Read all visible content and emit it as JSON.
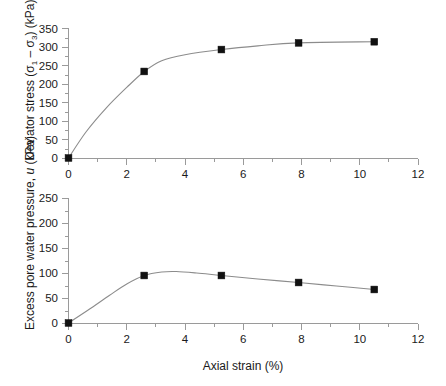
{
  "figure": {
    "background_color": "#ffffff",
    "line_color": "#8c8c8c",
    "marker_color": "#111111",
    "axis_color": "#9a9a9a",
    "text_color": "#1a1a1a"
  },
  "shared_axis": {
    "xlabel": "Axial strain (%)",
    "xticks": [
      "0",
      "2",
      "4",
      "6",
      "8",
      "10",
      "12"
    ],
    "xlim": [
      0,
      12
    ],
    "xtick_step": 2,
    "xminor_step": 1
  },
  "top_panel": {
    "ylabel_prefix": "Deviator stress (",
    "ylabel_sigma": "σ",
    "ylabel_sub1": "1",
    "ylabel_dash": " – ",
    "ylabel_sub3": "3",
    "ylabel_suffix": ") (kPa)",
    "yticks": [
      "0",
      "50",
      "100",
      "150",
      "200",
      "250",
      "300",
      "350"
    ],
    "ylim": [
      0,
      350
    ]
  },
  "bottom_panel": {
    "ylabel_prefix": "Excess pore water pressure, ",
    "ylabel_italic": "u",
    "ylabel_suffix": " (kPa)",
    "yticks": [
      "0",
      "50",
      "100",
      "150",
      "200",
      "250"
    ],
    "ylim": [
      0,
      250
    ]
  },
  "chart_data": [
    {
      "type": "line",
      "title": "",
      "panel": "top",
      "xlabel": "Axial strain (%)",
      "ylabel": "Deviator stress (σ1 – σ3) (kPa)",
      "xlim": [
        0,
        12
      ],
      "ylim": [
        0,
        350
      ],
      "xticks": [
        0,
        2,
        4,
        6,
        8,
        10,
        12
      ],
      "yticks": [
        0,
        50,
        100,
        150,
        200,
        250,
        300,
        350
      ],
      "grid": false,
      "legend": "none",
      "marker": "filled-square",
      "series": [
        {
          "name": "Deviator stress",
          "x": [
            0,
            2.6,
            5.25,
            7.9,
            10.5
          ],
          "values": [
            0,
            233,
            292,
            310,
            313
          ]
        }
      ],
      "curve_control_points": [
        [
          0,
          0
        ],
        [
          0.6,
          70
        ],
        [
          1.3,
          135
        ],
        [
          2.0,
          190
        ],
        [
          2.6,
          233
        ],
        [
          3.2,
          262
        ],
        [
          4.0,
          278
        ],
        [
          5.25,
          292
        ],
        [
          6.5,
          302
        ],
        [
          7.9,
          310
        ],
        [
          10.5,
          313
        ]
      ]
    },
    {
      "type": "line",
      "title": "",
      "panel": "bottom",
      "xlabel": "Axial strain (%)",
      "ylabel": "Excess pore water pressure, u (kPa)",
      "xlim": [
        0,
        12
      ],
      "ylim": [
        0,
        250
      ],
      "xticks": [
        0,
        2,
        4,
        6,
        8,
        10,
        12
      ],
      "yticks": [
        0,
        50,
        100,
        150,
        200,
        250
      ],
      "grid": false,
      "legend": "none",
      "marker": "filled-square",
      "series": [
        {
          "name": "Excess pore water pressure",
          "x": [
            0,
            2.6,
            5.25,
            7.9,
            10.5
          ],
          "values": [
            0,
            95,
            95,
            81,
            67
          ]
        }
      ],
      "curve_control_points": [
        [
          0,
          0
        ],
        [
          0.7,
          27
        ],
        [
          1.4,
          55
        ],
        [
          2.0,
          78
        ],
        [
          2.6,
          95
        ],
        [
          3.2,
          102
        ],
        [
          3.7,
          103
        ],
        [
          4.4,
          100
        ],
        [
          5.25,
          95
        ],
        [
          6.5,
          88
        ],
        [
          7.9,
          81
        ],
        [
          9.2,
          74
        ],
        [
          10.5,
          67
        ]
      ]
    }
  ]
}
